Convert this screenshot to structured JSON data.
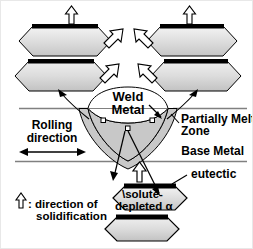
{
  "figure": {
    "background_color": "#ffffff",
    "border_color": "#e8e8e8"
  },
  "labels": {
    "weld_metal_line1": "Weld",
    "weld_metal_line2": "Metal",
    "partially_melted_line1": "Partially Melted",
    "partially_melted_line2": "Zone",
    "base_metal": "Base Metal",
    "rolling_line1": "Rolling",
    "rolling_line2": "direction",
    "eutectic": "eutectic",
    "solute_line1": "\\solute-",
    "solute_line2": "depleted α",
    "legend_line1": ": direction of",
    "legend_line2": "solidification"
  },
  "colors": {
    "grain_fill_light": "#f2f2f2",
    "grain_fill_mid": "#d9d9d9",
    "grain_fill_dark": "#c9c9c9",
    "eutectic_band": "#000000",
    "pmz_fill": "#c8c8c8",
    "weld_pool_fill": "#ffffff",
    "plate_line": "#808080",
    "outline": "#000000",
    "arrow_fill": "#ffffff"
  },
  "grains": {
    "top_left_upper": {
      "name": "grain-top-left-upper",
      "has_eutectic_band": true
    },
    "top_left_lower": {
      "name": "grain-top-left-lower",
      "has_eutectic_band": true
    },
    "top_right_upper": {
      "name": "grain-top-right-upper",
      "has_eutectic_band": true
    },
    "top_right_lower": {
      "name": "grain-top-right-lower",
      "has_eutectic_band": true
    },
    "bottom_upper": {
      "name": "grain-bottom-upper",
      "has_eutectic_band": true
    },
    "bottom_lower": {
      "name": "grain-bottom-lower",
      "has_eutectic_band": true
    }
  },
  "markers": {
    "count": 3,
    "shape": "square",
    "description": "solidification nucleation sites on fusion boundary"
  },
  "arrows": {
    "solidification_direction_count": 3,
    "grain_growth_diagonal_count": 4,
    "rolling_direction": "double-headed horizontal"
  }
}
